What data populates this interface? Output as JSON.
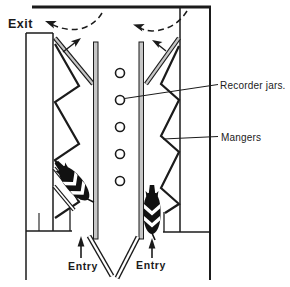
{
  "figure": {
    "type": "herringbone-milking-parlour-diagram",
    "labels": {
      "exit": "Exit",
      "recorder_jars": "Recorder jars.",
      "mangers": "Mangers",
      "entry_left": "Entry",
      "entry_right": "Entry"
    },
    "recorder_jar_count": 5,
    "cow_count": 2,
    "colors": {
      "line": "#1b1b1b",
      "rail_fill": "#c6c6c6",
      "gate_fill": "#ffffff",
      "cow_fill": "#111111",
      "background": "#ffffff"
    }
  }
}
